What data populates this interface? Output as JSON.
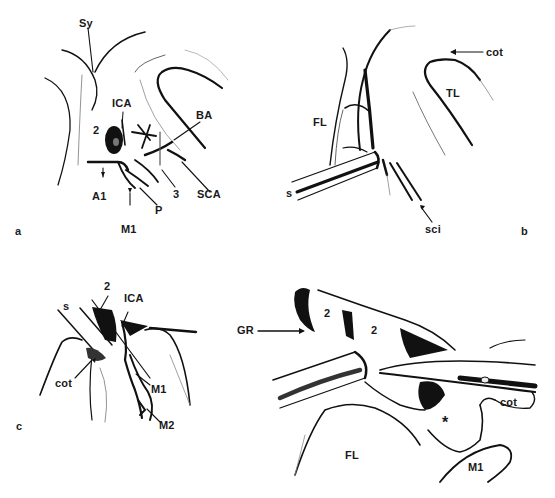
{
  "figure": {
    "panels": [
      {
        "id": "a",
        "letter": "a",
        "labels": {
          "sy": "Sy",
          "ica": "ICA",
          "ba": "BA",
          "n2": "2",
          "a1": "A1",
          "n3": "3",
          "sca": "SCA",
          "p": "P",
          "m1": "M1"
        }
      },
      {
        "id": "b",
        "letter": "b",
        "labels": {
          "cot": "cot",
          "tl": "TL",
          "fl": "FL",
          "s": "s",
          "sci": "sci"
        }
      },
      {
        "id": "c",
        "letter": "c",
        "labels": {
          "n2": "2",
          "s": "s",
          "ica": "ICA",
          "cot": "cot",
          "m1": "M1",
          "m2": "M2"
        }
      },
      {
        "id": "d",
        "letter": "",
        "labels": {
          "gr": "GR",
          "n2a": "2",
          "n2b": "2",
          "cot": "cot",
          "star": "*",
          "fl": "FL",
          "m1": "M1"
        }
      }
    ],
    "colors": {
      "ink": "#111111",
      "background": "#ffffff",
      "shade": "#9a9a9a"
    }
  }
}
